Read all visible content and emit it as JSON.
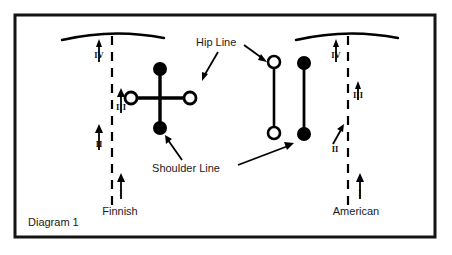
{
  "figure": {
    "caption": "Diagram 1",
    "border_color": "#111111",
    "ink_color": "#000000"
  },
  "annotations": {
    "hip_line_label": "Hip Line",
    "shoulder_line_label": "Shoulder Line"
  },
  "techniques": [
    {
      "name": "Finnish",
      "label": "Finnish",
      "phase_markers": [
        {
          "numeral": "I",
          "direction": "up"
        },
        {
          "numeral": "II",
          "direction": "up"
        },
        {
          "numeral": "III",
          "direction": "up"
        },
        {
          "numeral": "IV",
          "direction": "up"
        }
      ],
      "hip_line": {
        "orientation": "horizontal",
        "marker": "open-circle"
      },
      "shoulder_line": {
        "orientation": "vertical",
        "marker": "filled-circle"
      }
    },
    {
      "name": "American",
      "label": "American",
      "phase_markers": [
        {
          "numeral": "I",
          "direction": "up"
        },
        {
          "numeral": "II",
          "direction": "up-right"
        },
        {
          "numeral": "III",
          "direction": "up"
        },
        {
          "numeral": "IV",
          "direction": "up"
        }
      ],
      "hip_line": {
        "orientation": "vertical",
        "marker": "open-circle"
      },
      "shoulder_line": {
        "orientation": "vertical",
        "marker": "filled-circle"
      }
    }
  ]
}
